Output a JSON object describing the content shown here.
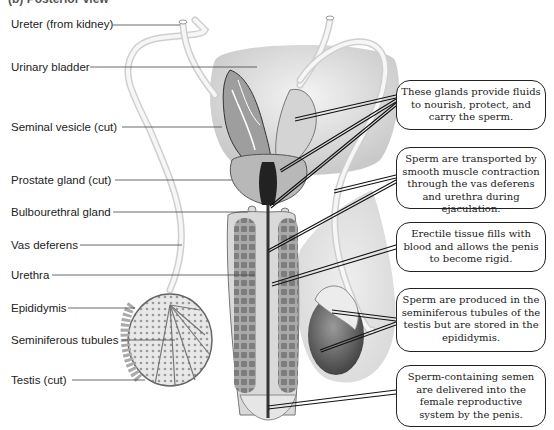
{
  "figure": {
    "title_partial": "(b) Posterior view",
    "labels": [
      {
        "id": "ureter",
        "text": "Ureter (from kidney)",
        "y": 17
      },
      {
        "id": "urinary-bladder",
        "text": "Urinary bladder",
        "y": 60
      },
      {
        "id": "seminal-vesicle",
        "text": "Seminal vesicle (cut)",
        "y": 120
      },
      {
        "id": "prostate-gland",
        "text": "Prostate gland (cut)",
        "y": 173
      },
      {
        "id": "bulbourethral-gland",
        "text": "Bulbourethral gland",
        "y": 205
      },
      {
        "id": "vas-deferens",
        "text": "Vas deferens",
        "y": 238
      },
      {
        "id": "urethra",
        "text": "Urethra",
        "y": 268
      },
      {
        "id": "epididymis",
        "text": "Epididymis",
        "y": 301
      },
      {
        "id": "seminiferous-tubules",
        "text": "Seminiferous tubules",
        "y": 333
      },
      {
        "id": "testis",
        "text": "Testis (cut)",
        "y": 373
      }
    ],
    "callouts": [
      {
        "id": "glands",
        "text": "These glands provide fluids to nourish, protect, and carry the sperm."
      },
      {
        "id": "transport",
        "text": "Sperm are transported by smooth muscle contraction through the vas deferens and urethra during ejaculation."
      },
      {
        "id": "erectile",
        "text": "Erectile tissue fills with blood and allows the penis to become rigid."
      },
      {
        "id": "production",
        "text": "Sperm are produced in the seminiferous tubules of the testis but are stored in the epididymis."
      },
      {
        "id": "delivery",
        "text": "Sperm-containing semen are delivered into the female reproductive system by the penis."
      }
    ]
  },
  "colors": {
    "ink": "#222222",
    "tissue_light": "#e6e6e6",
    "tissue_mid": "#bdbdbd",
    "tissue_dark": "#6e6e6e"
  }
}
